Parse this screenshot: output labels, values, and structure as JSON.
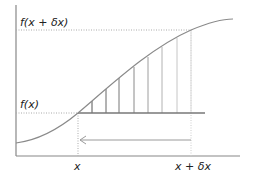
{
  "diagram": {
    "labels": {
      "f_x_plus_dx": "f(x + δx)",
      "f_x": "f(x)",
      "x": "x",
      "x_plus_dx": "x + δx"
    },
    "colors": {
      "axis": "#888888",
      "curve": "#8a8a8a",
      "dotted_guides": "#aaaaaa",
      "base_line": "#777777",
      "arrow": "#9a9a9a",
      "text": "#222222",
      "strip_lines": [
        "#555555",
        "#666666",
        "#777777",
        "#8a8a8a",
        "#9e9e9e",
        "#b2b2b2",
        "#c6c6c6",
        "#dadada"
      ]
    },
    "geometry": {
      "axis_origin": [
        16,
        156
      ],
      "y_axis_top": 5,
      "x_axis_right": 240,
      "x_pos": 78,
      "x_plus_dx_pos": 191,
      "f_x_level": 113,
      "f_x_plus_dx_level": 30,
      "base_line_end": 205,
      "arrow_y": 140,
      "strip_x": [
        92,
        106,
        119,
        134,
        148,
        162,
        177,
        191
      ]
    }
  }
}
